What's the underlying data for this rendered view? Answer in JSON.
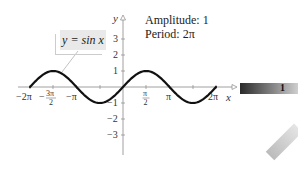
{
  "chart_data": {
    "type": "line",
    "title": "",
    "function": "y = sin x",
    "xlabel": "x",
    "ylabel": "y",
    "xlim": [
      -6.6,
      6.6
    ],
    "ylim": [
      -4,
      4
    ],
    "x_ticks": [
      "-2π",
      "-3π/2",
      "-π",
      "π/2",
      "π",
      "2π"
    ],
    "y_ticks": [
      "3",
      "2",
      "1",
      "-1",
      "-2",
      "-3"
    ],
    "series": [
      {
        "name": "y = sin x",
        "x_range": [
          -6.2832,
          6.2832
        ],
        "amplitude": 1,
        "period": "2π"
      }
    ],
    "annotations": [
      "Amplitude: 1",
      "Period: 2π"
    ],
    "grid": false,
    "legend": "callout box, upper left"
  },
  "equation_label": "y = sin x",
  "info": {
    "amplitude": "Amplitude: 1",
    "period": "Period: 2π"
  },
  "axes": {
    "x_label": "x",
    "y_label": "y",
    "y_ticks": [
      "3",
      "2",
      "1",
      "−1",
      "−2",
      "−3"
    ],
    "x_ticks": {
      "neg2pi": "−2π",
      "neg3pi2_num": "3π",
      "neg3pi2_den": "2",
      "negpi": "−π",
      "pi2_num": "π",
      "pi2_den": "2",
      "pi": "π",
      "twopi": "2π"
    }
  },
  "tab": {
    "label": "1"
  }
}
